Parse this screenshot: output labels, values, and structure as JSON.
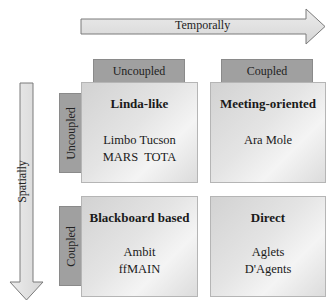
{
  "axes": {
    "horizontal": {
      "label": "Temporally",
      "direction": "right"
    },
    "vertical": {
      "label": "Spatially",
      "direction": "down"
    }
  },
  "column_headers": [
    {
      "label": "Uncoupled"
    },
    {
      "label": "Coupled"
    }
  ],
  "row_headers": [
    {
      "label": "Uncoupled"
    },
    {
      "label": "Coupled"
    }
  ],
  "cells": [
    {
      "title": "Linda-like",
      "items": [
        "Limbo Tucson",
        "MARS  TOTA"
      ]
    },
    {
      "title": "Meeting-oriented",
      "items": [
        "Ara Mole"
      ]
    },
    {
      "title": "Blackboard based",
      "items": [
        "Ambit",
        "ffMAIN"
      ]
    },
    {
      "title": "Direct",
      "items": [
        "Aglets",
        "D'Agents"
      ]
    }
  ],
  "colors": {
    "arrow_fill": "#e2e2e2",
    "arrow_stroke": "#7a7a7a",
    "header_tab": "#a0a0a0",
    "cell_light": "#f4f4f4",
    "cell_dark": "#d2d2d2"
  }
}
